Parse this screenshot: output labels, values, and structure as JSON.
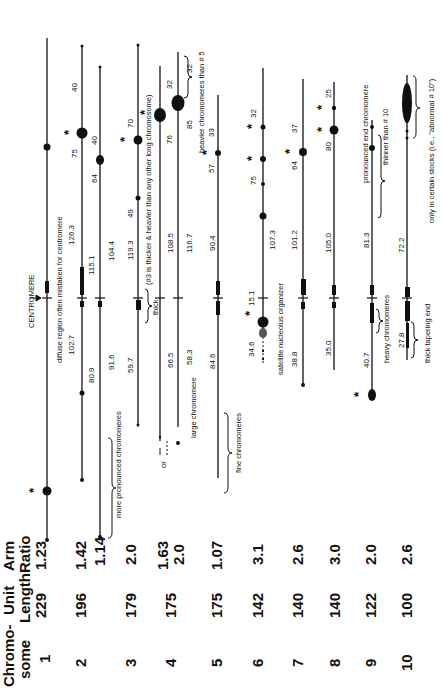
{
  "table": {
    "headers": [
      "Chromo-\nsome",
      "Unit\nLength",
      "Arm\nRatio"
    ],
    "header_lines": {
      "chromosome": [
        "Chromo-",
        "some"
      ],
      "unit_length": [
        "Unit",
        "Length"
      ],
      "arm_ratio": [
        "Arm",
        "Ratio"
      ]
    },
    "rows": [
      {
        "chromosome": "1",
        "unit_length": "229",
        "arm_ratio": "1.23"
      },
      {
        "chromosome": "2",
        "unit_length": "196",
        "arm_ratio": "1.42",
        "arm_ratio_alt": "1.14"
      },
      {
        "chromosome": "3",
        "unit_length": "179",
        "arm_ratio": "2.0"
      },
      {
        "chromosome": "4",
        "unit_length": "175",
        "arm_ratio": "1.63",
        "arm_ratio_alt": "2.0"
      },
      {
        "chromosome": "5",
        "unit_length": "175",
        "arm_ratio": "1.07"
      },
      {
        "chromosome": "6",
        "unit_length": "142",
        "arm_ratio": "3.1"
      },
      {
        "chromosome": "7",
        "unit_length": "140",
        "arm_ratio": "2.6"
      },
      {
        "chromosome": "8",
        "unit_length": "140",
        "arm_ratio": "3.0"
      },
      {
        "chromosome": "9",
        "unit_length": "122",
        "arm_ratio": "2.0"
      },
      {
        "chromosome": "10",
        "unit_length": "100",
        "arm_ratio": "2.6"
      }
    ]
  },
  "diagram": {
    "centromere_label": "CENTROMERE",
    "arm_lengths": {
      "chr1": {
        "short": "102.7",
        "long": "126.3"
      },
      "chr2": {
        "short": "80.9",
        "long": "115.1"
      },
      "chr2_alt": {
        "short": "91.6",
        "long": "104.4"
      },
      "chr3": {
        "short": "59.7",
        "long": "119.3"
      },
      "chr4": {
        "short": "66.5",
        "long": "108.5"
      },
      "chr4_alt": {
        "short": "58.3",
        "long": "116.7"
      },
      "chr5": {
        "short": "84.6",
        "long": "90.4"
      },
      "chr6": {
        "short": "34.6",
        "satellite_gap": "15.1",
        "long": "107.3"
      },
      "chr7": {
        "short": "38.8",
        "long": "101.2"
      },
      "chr8": {
        "short": "35.0",
        "long": "105.0"
      },
      "chr9": {
        "short": "40.7",
        "long": "81.3"
      },
      "chr10": {
        "short": "27.8",
        "long": "72.2"
      }
    },
    "knob_positions": {
      "chr2": [
        "75",
        "40"
      ],
      "chr2_alt": [
        "64",
        "40"
      ],
      "chr3": [
        "49",
        "70"
      ],
      "chr4": [
        "76",
        "32"
      ],
      "chr4_alt": [
        "85",
        "32"
      ],
      "chr5": [
        "57",
        "33"
      ],
      "chr6": [
        "75",
        "32"
      ],
      "chr7": [
        "64",
        "37"
      ],
      "chr8": [
        "80",
        "25"
      ]
    },
    "annotations": {
      "diffuse_region": "diffuse region often mistaken for centromere",
      "more_pronounced": "more pronounced chromomeres",
      "thick": "thick",
      "chr3_note": "(#3 is thicker & heavier than any other long chromosome)",
      "or": "or",
      "large_chromomere": "large chromomere",
      "heavier_chromomeres": "heavier chromomeres than # 5",
      "fine_chromomeres": "fine chromomeres",
      "satellite": "satellite",
      "nucleolus_organizer": "nucleolus organizer",
      "heavy_chromomeres": "heavy chromomeres",
      "pronounced_end": "pronounced end chromomere",
      "thinner_than": "thinner than # 10",
      "thick_tapering": "thick tapering end",
      "certain_stocks": "only in certain stocks (i.e., \"abnormal # 10\")"
    },
    "star_symbol": "*"
  }
}
